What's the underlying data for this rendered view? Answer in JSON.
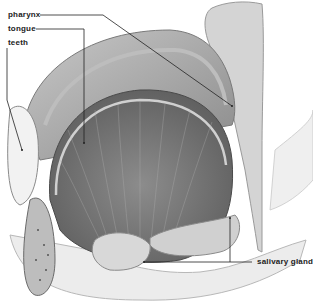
{
  "diagram": {
    "labels": [
      {
        "id": "pharynx",
        "text": "pharynx",
        "x": 8,
        "y": 10
      },
      {
        "id": "tongue",
        "text": "tongue",
        "x": 8,
        "y": 24
      },
      {
        "id": "teeth",
        "text": "teeth",
        "x": 8,
        "y": 38
      },
      {
        "id": "salivary-glands",
        "text": "salivary glands",
        "x": 257,
        "y": 257
      }
    ],
    "colors": {
      "background": "#ffffff",
      "ink": "#222222",
      "tissue_light": "#d9d9d9",
      "tissue_mid": "#a8a8a8",
      "tissue_dark": "#6e6e6e"
    }
  }
}
